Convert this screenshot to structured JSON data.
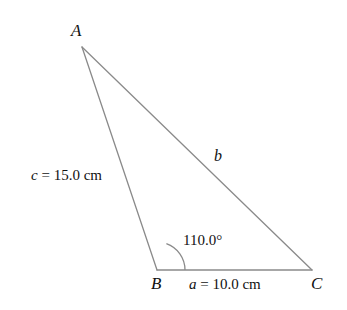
{
  "figure": {
    "type": "triangle-diagram",
    "background_color": "#ffffff",
    "stroke_color": "#8a8a8a",
    "text_color": "#111111",
    "vertices": [
      {
        "name": "A",
        "label": "A",
        "x": 82,
        "y": 47
      },
      {
        "name": "B",
        "label": "B",
        "x": 157,
        "y": 270
      },
      {
        "name": "C",
        "label": "C",
        "x": 312,
        "y": 270
      }
    ],
    "sides": [
      {
        "name": "a",
        "label": "a = 10.0 cm",
        "symbol": "a",
        "value_text": " = 10.0 cm",
        "between": "B-C",
        "length_cm": 10.0
      },
      {
        "name": "b",
        "label": "b",
        "symbol": "b",
        "value_text": "",
        "between": "A-C",
        "length_cm": null
      },
      {
        "name": "c",
        "label": "c = 15.0 cm",
        "symbol": "c",
        "value_text": " = 15.0 cm",
        "between": "A-B",
        "length_cm": 15.0
      }
    ],
    "angles": [
      {
        "at_vertex": "B",
        "label": "110.0°",
        "degrees": 110.0,
        "arc_radius": 28
      }
    ]
  }
}
